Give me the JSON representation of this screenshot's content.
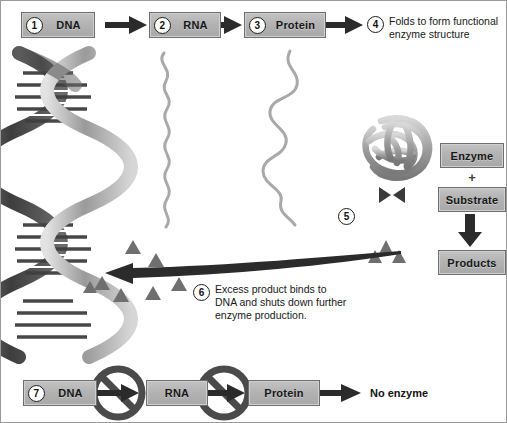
{
  "figure": {
    "background": "#ffffff",
    "border_color": "#9a9a9a"
  },
  "colors": {
    "box_fill": "#b3b3b3",
    "box_border": "#6e6e6e",
    "arrow_dark": "#2b2b2b",
    "strand_gray": "#a9a9a9",
    "helix_dark": "#4a4a4a",
    "helix_light": "#c9c9c9",
    "triangle_gray": "#6f6f6f",
    "text": "#181818"
  },
  "top_row": {
    "step1": {
      "number": "1",
      "label": "DNA"
    },
    "step2": {
      "number": "2",
      "label": "RNA"
    },
    "step3": {
      "number": "3",
      "label": "Protein"
    },
    "step4": {
      "number": "4",
      "label": "Folds to form functional\nenzyme structure"
    }
  },
  "reaction": {
    "step5": {
      "number": "5"
    },
    "enzyme_label": "Enzyme",
    "plus": "+",
    "substrate_label": "Substrate",
    "products_label": "Products"
  },
  "feedback": {
    "step6": {
      "number": "6",
      "text": "Excess product binds to\nDNA and shuts down further\nenzyme production."
    }
  },
  "bottom_row": {
    "step7": {
      "number": "7",
      "label": "DNA"
    },
    "rna_label": "RNA",
    "protein_label": "Protein",
    "result_label": "No enzyme",
    "blocked_icon": "no-entry-icon"
  },
  "icons": {
    "dna_helix": "dna-double-helix-icon",
    "rna_strand": "rna-strand-icon",
    "protein_chain": "protein-chain-icon",
    "folded_enzyme": "folded-enzyme-globule-icon",
    "substrate_shape": "substrate-bowtie-icon",
    "product_triangle": "product-triangle-icon",
    "arrow_right": "arrow-right-icon",
    "arrow_down": "arrow-down-icon",
    "arrow_left_long": "feedback-arrow-left-icon",
    "prohibition": "prohibition-sign-icon"
  }
}
